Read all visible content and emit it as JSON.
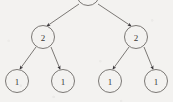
{
  "figure": {
    "type": "binary-tree-diagram",
    "title": "",
    "background_color": "#f3f2f0",
    "stroke_color": "#6d6a66",
    "arrow_color": "#39363a",
    "label_color": "#3a3836"
  },
  "tree": {
    "node_radius": 11.5,
    "nodes": [
      {
        "id": "root",
        "label": "",
        "cx": 88,
        "cy": -6,
        "level": 0,
        "clipped": true
      },
      {
        "id": "n-l",
        "label": "2",
        "cx": 43,
        "cy": 37,
        "level": 1,
        "clipped": false
      },
      {
        "id": "n-r",
        "label": "2",
        "cx": 136,
        "cy": 37,
        "level": 1,
        "clipped": false
      },
      {
        "id": "n-ll",
        "label": "1",
        "cx": 17,
        "cy": 81,
        "level": 2,
        "clipped": false
      },
      {
        "id": "n-lr",
        "label": "1",
        "cx": 63,
        "cy": 81,
        "level": 2,
        "clipped": false
      },
      {
        "id": "n-rl",
        "label": "1",
        "cx": 110,
        "cy": 81,
        "level": 2,
        "clipped": false
      },
      {
        "id": "n-rr",
        "label": "1",
        "cx": 156,
        "cy": 81,
        "level": 2,
        "clipped": false
      }
    ],
    "edges": [
      {
        "from": "root",
        "to": "n-l",
        "x1": 79,
        "y1": 4,
        "x2": 47,
        "y2": 26,
        "arrow": true
      },
      {
        "from": "root",
        "to": "n-r",
        "x1": 98,
        "y1": 4,
        "x2": 131,
        "y2": 26,
        "arrow": true
      },
      {
        "from": "n-l",
        "to": "n-ll",
        "x1": 36,
        "y1": 47,
        "x2": 20,
        "y2": 69,
        "arrow": true
      },
      {
        "from": "n-l",
        "to": "n-lr",
        "x1": 51,
        "y1": 47,
        "x2": 60,
        "y2": 69,
        "arrow": true
      },
      {
        "from": "n-r",
        "to": "n-rl",
        "x1": 129,
        "y1": 47,
        "x2": 113,
        "y2": 69,
        "arrow": true
      },
      {
        "from": "n-r",
        "to": "n-rr",
        "x1": 144,
        "y1": 47,
        "x2": 153,
        "y2": 69,
        "arrow": true
      }
    ]
  }
}
